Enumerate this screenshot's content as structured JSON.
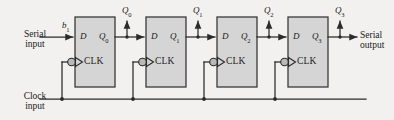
{
  "figure": {
    "colors": {
      "background": "#f2f1ef",
      "box_fill": "#d5d5d5",
      "box_stroke": "#3a3a3a",
      "wire": "#2b2b2b",
      "text": "#1a1a1a"
    },
    "inputs": {
      "serial_input_line1": "Serial",
      "serial_input_line2": "input",
      "serial_input_signal": "b",
      "serial_input_signal_sub": "1",
      "clock_input_line1": "Clock",
      "clock_input_line2": "input"
    },
    "outputs": {
      "serial_output_line1": "Serial",
      "serial_output_line2": "output"
    },
    "flipflops": [
      {
        "d_label": "D",
        "q_label": "Q",
        "q_sub": "0",
        "clk_label": "CLK"
      },
      {
        "d_label": "D",
        "q_label": "Q",
        "q_sub": "1",
        "clk_label": "CLK"
      },
      {
        "d_label": "D",
        "q_label": "Q",
        "q_sub": "2",
        "clk_label": "CLK"
      },
      {
        "d_label": "D",
        "q_label": "Q",
        "q_sub": "3",
        "clk_label": "CLK"
      }
    ],
    "top_outputs": [
      {
        "label": "Q",
        "sub": "0"
      },
      {
        "label": "Q",
        "sub": "1"
      },
      {
        "label": "Q",
        "sub": "2"
      },
      {
        "label": "Q",
        "sub": "3"
      }
    ]
  }
}
